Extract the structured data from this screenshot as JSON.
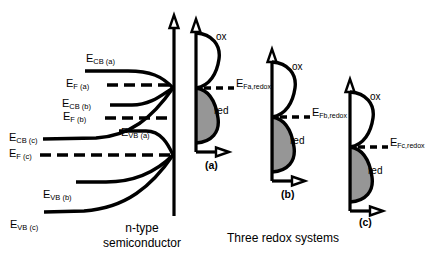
{
  "figure": {
    "type": "energy-band-diagram",
    "semiconductor_caption_line1": "n-type",
    "semiconductor_caption_line2": "semiconductor",
    "redox_caption": "Three redox systems",
    "colors": {
      "line": "#000000",
      "red_fill": "#969696",
      "background": "#ffffff"
    }
  },
  "semiconductor": {
    "bands": [
      {
        "id": "cb_a",
        "label_main": "E",
        "label_sub": "CB (a)",
        "label_x": 86,
        "label_y": 59,
        "kind": "solid"
      },
      {
        "id": "ef_a",
        "label_main": "E",
        "label_sub": "F (a)",
        "label_x": 88,
        "label_y": 79,
        "kind": "dashed"
      },
      {
        "id": "cb_b",
        "label_main": "E",
        "label_sub": "CB (b)",
        "label_x": 81,
        "label_y": 99,
        "kind": "solid"
      },
      {
        "id": "ef_b",
        "label_main": "E",
        "label_sub": "F (b)",
        "label_x": 84,
        "label_y": 113,
        "kind": "dashed"
      },
      {
        "id": "cb_c",
        "label_main": "E",
        "label_sub": "CB (c)",
        "label_x": 12,
        "label_y": 134,
        "kind": "solid"
      },
      {
        "id": "ef_c",
        "label_main": "E",
        "label_sub": "F (c)",
        "label_x": 16,
        "label_y": 152,
        "kind": "dashed"
      },
      {
        "id": "vb_a",
        "label_main": "E",
        "label_sub": "VB (a)",
        "label_x": 122,
        "label_y": 130,
        "kind": "solid"
      },
      {
        "id": "vb_b",
        "label_main": "E",
        "label_sub": "VB (b)",
        "label_x": 48,
        "label_y": 186,
        "kind": "solid"
      },
      {
        "id": "vb_c",
        "label_main": "E",
        "label_sub": "VB (c)",
        "label_x": 12,
        "label_y": 220,
        "kind": "solid"
      }
    ]
  },
  "redox_systems": [
    {
      "id": "a",
      "tag": "(a)",
      "tag_x": 212,
      "tag_y": 167,
      "ox_label": "ox",
      "ox_x": 221,
      "ox_y": 38,
      "red_label": "red",
      "red_x": 218,
      "red_y": 113,
      "fermi_label_main": "E",
      "fermi_label_sub": "Fa,redox",
      "fermi_label_x": 237,
      "fermi_label_y": 81,
      "axis_x": 196,
      "axis_top_y": 20,
      "axis_bottom_y": 152,
      "fermi_y": 88
    },
    {
      "id": "b",
      "tag": "(b)",
      "tag_x": 288,
      "tag_y": 196,
      "ox_label": "ox",
      "ox_x": 297,
      "ox_y": 68,
      "red_label": "red",
      "red_x": 294,
      "red_y": 142,
      "fermi_label_main": "E",
      "fermi_label_sub": "Fb,redox",
      "fermi_label_x": 313,
      "fermi_label_y": 110,
      "axis_x": 272,
      "axis_top_y": 50,
      "axis_bottom_y": 181,
      "fermi_y": 117
    },
    {
      "id": "c",
      "tag": "(c)",
      "tag_x": 366,
      "tag_y": 224,
      "ox_label": "ox",
      "ox_x": 375,
      "ox_y": 98,
      "red_label": "red",
      "red_x": 372,
      "red_y": 172,
      "fermi_label_main": "E",
      "fermi_label_sub": "Fc,redox",
      "fermi_label_x": 391,
      "fermi_label_y": 140,
      "axis_x": 350,
      "axis_top_y": 80,
      "axis_bottom_y": 211,
      "fermi_y": 147
    }
  ],
  "captions": {
    "semiconductor_x": 140,
    "semiconductor_y": 222,
    "redox_x": 283,
    "redox_y": 237
  }
}
